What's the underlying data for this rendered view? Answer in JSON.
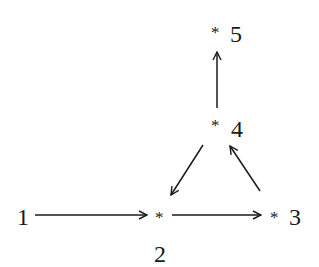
{
  "diagram": {
    "type": "directed-graph",
    "nodes": [
      {
        "id": "1",
        "label": "1",
        "marker": ""
      },
      {
        "id": "2",
        "label": "2",
        "marker": "*"
      },
      {
        "id": "3",
        "label": "3",
        "marker": "*"
      },
      {
        "id": "4",
        "label": "4",
        "marker": "*"
      },
      {
        "id": "5",
        "label": "5",
        "marker": "*"
      }
    ],
    "edges": [
      {
        "from": "1",
        "to": "2"
      },
      {
        "from": "2",
        "to": "3"
      },
      {
        "from": "3",
        "to": "4"
      },
      {
        "from": "4",
        "to": "2"
      },
      {
        "from": "4",
        "to": "5"
      }
    ],
    "colors": {
      "stroke": "#1a1a1a",
      "background": "#ffffff"
    }
  }
}
